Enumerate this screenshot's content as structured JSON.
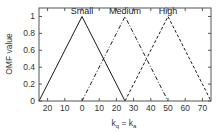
{
  "chart_data": {
    "type": "line",
    "title": "",
    "xlabel": "k_q = k_a",
    "xlabel_parts": {
      "k1": "k",
      "sub1": "q",
      "eq": " = ",
      "k2": "k",
      "sub2": "a"
    },
    "ylabel": "OMF value",
    "xlim": [
      -25,
      75
    ],
    "ylim": [
      0,
      1.1
    ],
    "grid": false,
    "legend": "none",
    "x_ticks": [
      -20,
      -10,
      0,
      10,
      20,
      30,
      40,
      50,
      60,
      70
    ],
    "x_tick_labels": [
      "20",
      "10",
      "0",
      "10",
      "20",
      "30",
      "40",
      "50",
      "60",
      "70"
    ],
    "y_ticks": [
      0,
      0.2,
      0.4,
      0.6,
      0.8,
      1
    ],
    "y_tick_labels": [
      "0",
      "0.2",
      "0.4",
      "0.6",
      "0.8",
      "1"
    ],
    "series": [
      {
        "name": "Small",
        "style": "solid",
        "x": [
          -25,
          0,
          25
        ],
        "y": [
          0,
          1,
          0
        ]
      },
      {
        "name": "Medium",
        "style": "dashdot",
        "x": [
          0,
          25,
          50
        ],
        "y": [
          0,
          1,
          0
        ]
      },
      {
        "name": "High",
        "style": "dashed",
        "x": [
          25,
          50,
          75
        ],
        "y": [
          0,
          1,
          0
        ]
      }
    ],
    "annotations": [
      {
        "text": "Small",
        "x": 0,
        "y": 1
      },
      {
        "text": "Medium",
        "x": 25,
        "y": 1
      },
      {
        "text": "High",
        "x": 50,
        "y": 1
      }
    ]
  },
  "colors": {
    "line": "#1a1a1a",
    "axis": "#555555"
  }
}
